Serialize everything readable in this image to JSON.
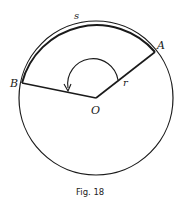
{
  "figure": {
    "caption": "Fig. 18",
    "labels": {
      "arc": "s",
      "point_a": "A",
      "point_b": "B",
      "center": "O",
      "radius": "r"
    },
    "circle": {
      "cx": 96,
      "cy": 98,
      "r": 77
    },
    "points": {
      "A": [
        155,
        52
      ],
      "B": [
        22,
        83
      ],
      "O": [
        96,
        98
      ]
    },
    "colors": {
      "stroke": "#1a1a1a",
      "background": "#ffffff"
    }
  }
}
